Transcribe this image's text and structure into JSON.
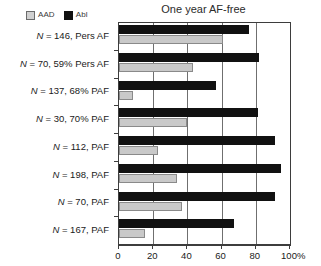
{
  "chart_data": {
    "type": "bar",
    "orientation": "horizontal",
    "title": "One year AF-free",
    "xlabel": "",
    "ylabel": "",
    "xlim": [
      0,
      100
    ],
    "xticks": [
      0,
      20,
      40,
      60,
      80,
      100
    ],
    "xtick_labels": [
      "0",
      "20",
      "40",
      "60",
      "80",
      "100"
    ],
    "x_unit": "%",
    "grid": true,
    "grid_axis": "x",
    "legend_position": "top-left",
    "categories": [
      "N = 146, Pers AF",
      "N = 70, 59% Pers AF",
      "N = 137, 68% PAF",
      "N = 30, 70% PAF",
      "N = 112, PAF",
      "N = 198, PAF",
      "N = 70, PAF",
      "N = 167, PAF"
    ],
    "series": [
      {
        "name": "AAD",
        "color": "#c9c9c9",
        "values": [
          61,
          43,
          8,
          40,
          23,
          34,
          37,
          15
        ]
      },
      {
        "name": "Abl",
        "color": "#111111",
        "values": [
          76,
          82,
          57,
          81,
          91,
          95,
          91,
          67
        ]
      }
    ]
  },
  "legend": {
    "entries": [
      {
        "label": "AAD",
        "swatch": "legend-swatch-aad"
      },
      {
        "label": "Abl",
        "swatch": "legend-swatch-abl"
      }
    ]
  }
}
